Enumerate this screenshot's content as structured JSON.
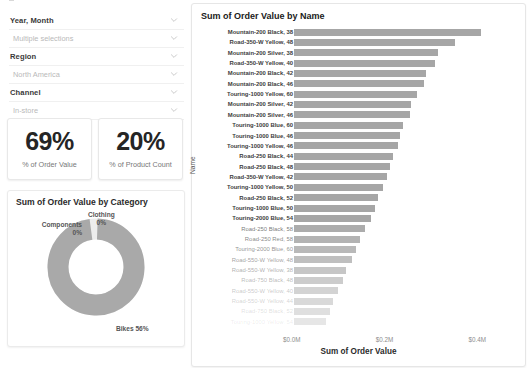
{
  "filters": {
    "rows": [
      {
        "type": "label",
        "text": "Year, Month",
        "icon": "chevron-down-icon"
      },
      {
        "type": "value",
        "text": "Multiple selections",
        "icon": "chevron-down-icon"
      },
      {
        "type": "label",
        "text": "Region",
        "icon": "chevron-down-icon"
      },
      {
        "type": "value",
        "text": "North America",
        "icon": "chevron-down-icon"
      },
      {
        "type": "label",
        "text": "Channel",
        "icon": "chevron-down-icon"
      },
      {
        "type": "value",
        "text": "In-store",
        "icon": "chevron-down-icon"
      }
    ]
  },
  "kpis": [
    {
      "value": "69%",
      "label": "% of Order Value"
    },
    {
      "value": "20%",
      "label": "% of Product Count"
    }
  ],
  "donut": {
    "title": "Sum of Order Value by Category",
    "labels": {
      "bikes": "Bikes 56%",
      "clothing_name": "Clothing",
      "clothing_pct": "0%",
      "components_name": "Components",
      "components_pct": "0%"
    }
  },
  "bar": {
    "title": "Sum of Order Value by Name",
    "ylabel": "Name",
    "xlabel": "Sum of Order Value",
    "xticks": [
      "$0.0M",
      "$0.2M",
      "$0.4M"
    ]
  },
  "chart_data": {
    "type": "bar",
    "title": "Sum of Order Value by Name",
    "xlabel": "Sum of Order Value",
    "ylabel": "Name",
    "orientation": "horizontal",
    "xlim": [
      0,
      0.47
    ],
    "xticks": [
      0,
      0.2,
      0.4
    ],
    "xtick_labels": [
      "$0.0M",
      "$0.2M",
      "$0.4M"
    ],
    "grid": false,
    "units": "millions of dollars",
    "categories": [
      "Mountain-200 Black, 38",
      "Road-350-W Yellow, 48",
      "Mountain-200 Silver, 38",
      "Road-350-W Yellow, 40",
      "Mountain-200 Black, 42",
      "Mountain-200 Black, 46",
      "Touring-1000 Yellow, 60",
      "Mountain-200 Silver, 42",
      "Mountain-200 Silver, 46",
      "Touring-1000 Blue, 60",
      "Touring-1000 Blue, 46",
      "Touring-1000 Yellow, 46",
      "Road-250 Black, 44",
      "Road-250 Black, 48",
      "Road-350-W Yellow, 42",
      "Touring-1000 Yellow, 50",
      "Road-250 Black, 52",
      "Touring-1000 Blue, 50",
      "Touring-2000 Blue, 54",
      "Road-250 Black, 58",
      "Road-250 Red, 58",
      "Touring-2000 Blue, 60",
      "Road-550-W Yellow, 48",
      "Road-550-W Yellow, 38",
      "Road-750 Black, 48",
      "Road-550-W Yellow, 40",
      "Road-550-W Yellow, 44",
      "Road-750 Black, 52",
      "Touring-1000 Yellow, 54"
    ],
    "values": [
      0.404,
      0.347,
      0.311,
      0.305,
      0.284,
      0.281,
      0.266,
      0.253,
      0.25,
      0.234,
      0.229,
      0.225,
      0.213,
      0.206,
      0.201,
      0.192,
      0.182,
      0.175,
      0.167,
      0.152,
      0.143,
      0.134,
      0.124,
      0.113,
      0.105,
      0.094,
      0.085,
      0.077,
      0.069
    ],
    "series": [
      {
        "name": "Sum of Order Value",
        "values": [
          0.404,
          0.347,
          0.311,
          0.305,
          0.284,
          0.281,
          0.266,
          0.253,
          0.25,
          0.234,
          0.229,
          0.225,
          0.213,
          0.206,
          0.201,
          0.192,
          0.182,
          0.175,
          0.167,
          0.152,
          0.143,
          0.134,
          0.124,
          0.113,
          0.105,
          0.094,
          0.085,
          0.077,
          0.069
        ]
      }
    ],
    "note": "Bars and labels below index 18 are rendered faded/greyed-out (cut off by visible scroll region)",
    "faded_from_index": 19
  },
  "donut_data": {
    "type": "pie",
    "title": "Sum of Order Value by Category",
    "labels": [
      "Bikes",
      "Clothing",
      "Components"
    ],
    "values": [
      56,
      0,
      0
    ],
    "display_labels": [
      "Bikes 56%",
      "Clothing 0%",
      "Components 0%"
    ],
    "hole": 0.58
  },
  "colors": {
    "bar": "#a6a6a6",
    "bar_faded": "#e2e2e2",
    "donut": "#a9a9a9",
    "text": "#3b3b3b",
    "muted": "#b9b9b9"
  }
}
